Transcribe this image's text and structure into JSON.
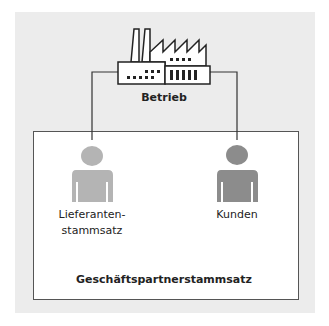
{
  "diagram": {
    "top_node": {
      "label": "Betrieb",
      "icon": "factory-icon"
    },
    "container": {
      "label": "Geschäftspartnerstammsatz"
    },
    "children": [
      {
        "label_line1": "Lieferanten-",
        "label_line2": "stammsatz",
        "icon": "person-icon",
        "color": "#b4b4b4"
      },
      {
        "label_line1": "Kunden",
        "icon": "person-icon",
        "color": "#8c8c8c"
      }
    ],
    "colors": {
      "panel_bg": "#ececec",
      "box_bg": "#ffffff",
      "line": "#333333"
    }
  }
}
